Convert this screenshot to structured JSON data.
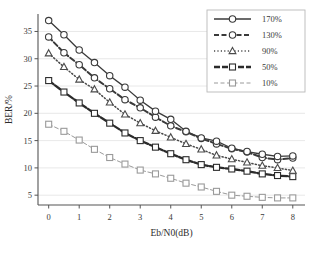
{
  "chart_data": {
    "type": "line",
    "title": "",
    "xlabel": "Eb/N0(dB)",
    "ylabel": "BER/%",
    "xlim": [
      -0.35,
      8.4
    ],
    "ylim": [
      3.2,
      38.2
    ],
    "xticks": [
      "0",
      "1",
      "2",
      "3",
      "4",
      "5",
      "6",
      "7",
      "8"
    ],
    "xtick_values": [
      0,
      1,
      2,
      3,
      4,
      5,
      6,
      7,
      8
    ],
    "yticks": [
      "5",
      "10",
      "15",
      "20",
      "25",
      "30",
      "35"
    ],
    "ytick_values": [
      5,
      10,
      15,
      20,
      25,
      30,
      35
    ],
    "grid": true,
    "legend_position": "top-right",
    "x": [
      0,
      0.5,
      1,
      1.5,
      2,
      2.5,
      3,
      3.5,
      4,
      4.5,
      5,
      5.5,
      6,
      6.5,
      7,
      7.5,
      8
    ],
    "series": [
      {
        "name": "170%",
        "marker": "circle",
        "line_style": "solid",
        "color": "#3a3a3a",
        "values": [
          37.0,
          34.4,
          31.6,
          29.3,
          26.9,
          24.8,
          22.4,
          20.4,
          18.9,
          16.7,
          15.5,
          14.9,
          13.6,
          13.0,
          12.5,
          12.1,
          12.2
        ]
      },
      {
        "name": "130%",
        "marker": "circle",
        "line_style": "dashed",
        "color": "#3a3a3a",
        "values": [
          34.0,
          31.1,
          28.9,
          26.5,
          24.5,
          22.5,
          21.0,
          19.3,
          17.7,
          16.6,
          15.4,
          14.4,
          13.5,
          12.9,
          11.9,
          11.5,
          11.8
        ]
      },
      {
        "name": "90%",
        "marker": "triangle",
        "line_style": "dotted",
        "color": "#4a4a4a",
        "values": [
          31.0,
          28.5,
          26.2,
          24.4,
          22.0,
          19.8,
          18.2,
          16.8,
          15.6,
          14.4,
          13.4,
          12.3,
          11.6,
          11.0,
          10.4,
          10.0,
          9.5
        ]
      },
      {
        "name": "50%",
        "marker": "square",
        "line_style": "thick-dashed",
        "color": "#2b2b2b",
        "values": [
          26.0,
          23.9,
          21.9,
          20.0,
          18.2,
          16.4,
          15.0,
          13.8,
          12.6,
          11.5,
          10.6,
          10.1,
          9.8,
          9.4,
          8.9,
          8.6,
          8.4
        ]
      },
      {
        "name": "10%",
        "marker": "square",
        "line_style": "light-dashed",
        "color": "#9a9a9a",
        "values": [
          18.0,
          16.7,
          15.1,
          13.4,
          11.9,
          10.7,
          9.6,
          8.9,
          8.1,
          7.2,
          6.5,
          5.7,
          5.0,
          4.8,
          4.6,
          4.5,
          4.5
        ]
      }
    ],
    "legend": [
      {
        "label": "170%",
        "marker": "circle",
        "line_style": "solid"
      },
      {
        "label": "130%",
        "marker": "circle",
        "line_style": "dashed"
      },
      {
        "label": "90%",
        "marker": "triangle",
        "line_style": "dotted"
      },
      {
        "label": "50%",
        "marker": "square",
        "line_style": "thick-dashed"
      },
      {
        "label": "10%",
        "marker": "square",
        "line_style": "light-dashed"
      }
    ]
  },
  "colors": {
    "axis": "#555555",
    "grid": "#e2e2e2",
    "background": "#ffffff",
    "legend_border": "#b9b9b9"
  }
}
